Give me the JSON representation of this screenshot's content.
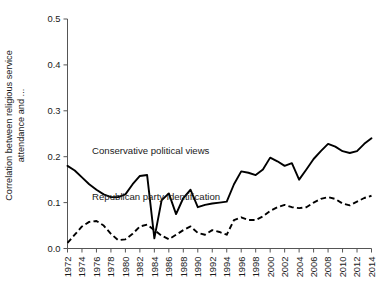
{
  "chart_data": {
    "type": "line",
    "title": "",
    "xlabel": "",
    "ylabel_line1": "Correlation between religious service",
    "ylabel_line2": "attendance and ...",
    "ylim": [
      0.0,
      0.5
    ],
    "xlim": [
      1972,
      2014
    ],
    "grid": false,
    "legend_position": "inline-annotation",
    "ytick_labels": [
      "0.0",
      "0.1",
      "0.2",
      "0.3",
      "0.4",
      "0.5"
    ],
    "ytick_values": [
      0.0,
      0.1,
      0.2,
      0.3,
      0.4,
      0.5
    ],
    "xtick_labels": [
      "1972",
      "1974",
      "1976",
      "1978",
      "1980",
      "1982",
      "1984",
      "1986",
      "1988",
      "1990",
      "1992",
      "1994",
      "1996",
      "1998",
      "2000",
      "2002",
      "2004",
      "2006",
      "2008",
      "2010",
      "2012",
      "2014"
    ],
    "xtick_values": [
      1972,
      1974,
      1976,
      1978,
      1980,
      1982,
      1984,
      1986,
      1988,
      1990,
      1992,
      1994,
      1996,
      1998,
      2000,
      2002,
      2004,
      2006,
      2008,
      2010,
      2012,
      2014
    ],
    "x": [
      1972,
      1973,
      1974,
      1975,
      1976,
      1977,
      1978,
      1979,
      1980,
      1981,
      1982,
      1983,
      1984,
      1985,
      1986,
      1987,
      1988,
      1989,
      1990,
      1991,
      1992,
      1993,
      1994,
      1995,
      1996,
      1997,
      1998,
      1999,
      2000,
      2001,
      2002,
      2003,
      2004,
      2005,
      2006,
      2007,
      2008,
      2009,
      2010,
      2011,
      2012,
      2013,
      2014
    ],
    "series": [
      {
        "name": "Conservative political views",
        "style": "solid",
        "color": "#000000",
        "values": [
          0.18,
          0.17,
          0.155,
          0.14,
          0.128,
          0.118,
          0.112,
          0.112,
          0.118,
          0.14,
          0.158,
          0.16,
          0.022,
          0.105,
          0.12,
          0.075,
          0.11,
          0.128,
          0.09,
          0.095,
          0.098,
          0.1,
          0.102,
          0.14,
          0.168,
          0.165,
          0.16,
          0.172,
          0.198,
          0.19,
          0.18,
          0.186,
          0.15,
          0.172,
          0.195,
          0.212,
          0.228,
          0.222,
          0.212,
          0.208,
          0.212,
          0.228,
          0.24
        ]
      },
      {
        "name": "Republican party identification",
        "style": "dashed",
        "color": "#000000",
        "values": [
          0.012,
          0.03,
          0.048,
          0.058,
          0.06,
          0.05,
          0.032,
          0.018,
          0.02,
          0.032,
          0.048,
          0.052,
          0.04,
          0.028,
          0.02,
          0.03,
          0.04,
          0.048,
          0.034,
          0.03,
          0.04,
          0.036,
          0.03,
          0.062,
          0.068,
          0.062,
          0.062,
          0.07,
          0.082,
          0.09,
          0.095,
          0.09,
          0.088,
          0.09,
          0.1,
          0.108,
          0.112,
          0.108,
          0.098,
          0.094,
          0.102,
          0.11,
          0.115
        ]
      }
    ],
    "annotations": [
      {
        "text": "Conservative political views",
        "x": 1975.4,
        "y": 0.205,
        "series": "Conservative political views"
      },
      {
        "text": "Republican party identification",
        "x": 1975.4,
        "y": 0.106,
        "series": "Republican party identification"
      }
    ]
  }
}
